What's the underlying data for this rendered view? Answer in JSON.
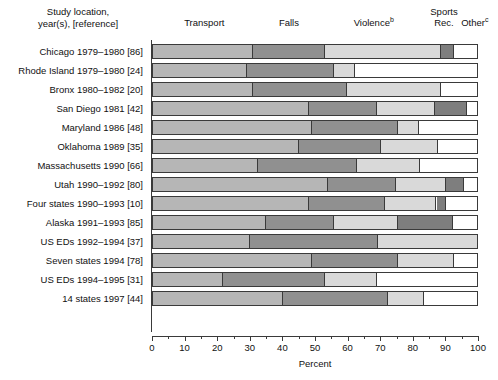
{
  "row_header": {
    "line1": "Study location,",
    "line2": "year(s), [reference]"
  },
  "axis": {
    "title": "Percent",
    "ticks": [
      0,
      10,
      20,
      30,
      40,
      50,
      60,
      70,
      80,
      90,
      100
    ],
    "tick_labels": [
      "0",
      "10",
      "20",
      "30",
      "40",
      "50",
      "60",
      "70",
      "80",
      "90",
      "100"
    ],
    "minor_ticks": [
      5,
      15,
      25,
      35,
      45,
      55,
      65,
      75,
      85,
      95
    ],
    "min": 0,
    "max": 100
  },
  "category_headers": [
    {
      "label": "Transport",
      "sup": "",
      "center_pct": 16
    },
    {
      "label": "Falls",
      "sup": "",
      "center_pct": 42
    },
    {
      "label": "Violence",
      "sup": "b",
      "center_pct": 68
    },
    {
      "label": "Sports Rec.",
      "sup": "",
      "center_pct": 89.5
    },
    {
      "label": "Other",
      "sup": "c",
      "center_pct": 99
    }
  ],
  "colors": {
    "transport": "#b6b6b6",
    "falls": "#909090",
    "violence": "#d9d9d9",
    "sports_rec": "#7e7e7e",
    "other": "#ffffff",
    "outline": "#3a3a3a",
    "text": "#111111",
    "background": "#ffffff"
  },
  "chart_data": {
    "type": "bar",
    "title": "",
    "subtitle": "",
    "orientation": "horizontal",
    "stacked": true,
    "stack_total": 100,
    "xlabel": "Percent",
    "ylabel": "Study location, year(s), [reference]",
    "xlim": [
      0,
      100
    ],
    "xticks": [
      0,
      10,
      20,
      30,
      40,
      50,
      60,
      70,
      80,
      90,
      100
    ],
    "grid": false,
    "legend": "column-headers-above-plot",
    "categories": [
      "Chicago 1979–1980 [86]",
      "Rhode Island 1979–1980 [24]",
      "Bronx 1980–1982 [20]",
      "San Diego 1981 [42]",
      "Maryland 1986 [48]",
      "Oklahoma 1989 [35]",
      "Massachusetts 1990 [66]",
      "Utah 1990–1992 [80]",
      "Four states 1990–1993 [10]",
      "Alaska 1991–1993 [85]",
      "US EDs 1992–1994 [37]",
      "Seven states 1994 [78]",
      "US EDs 1994–1995 [31]",
      "14 states 1997 [44]"
    ],
    "series": [
      {
        "name": "Transport",
        "color": "#b6b6b6",
        "values": [
          31,
          29,
          31,
          48,
          49,
          45,
          32.5,
          54,
          48,
          35,
          30,
          49,
          21.5,
          40
        ]
      },
      {
        "name": "Falls",
        "color": "#909090",
        "values": [
          22,
          27,
          29,
          21,
          26.5,
          25.5,
          30.5,
          21,
          23.5,
          21,
          39.5,
          26.5,
          31.5,
          32.5
        ]
      },
      {
        "name": "Violence",
        "color": "#d9d9d9",
        "values": [
          36,
          6.5,
          29,
          18,
          6.5,
          17.5,
          19.5,
          15.5,
          16,
          19.5,
          30.5,
          17.5,
          16,
          11
        ]
      },
      {
        "name": "Sports Rec.",
        "color": "#7e7e7e",
        "values": [
          4,
          0,
          0,
          10,
          0,
          0,
          0,
          5.5,
          3,
          17,
          0,
          0,
          0,
          0
        ]
      },
      {
        "name": "Other",
        "color": "#ffffff",
        "values": [
          7,
          37.5,
          11,
          3,
          18,
          12,
          17.5,
          4,
          9.5,
          7.5,
          0,
          7,
          31,
          16.5
        ]
      }
    ],
    "cumulative_boundaries": [
      [
        31,
        53,
        89,
        93,
        100
      ],
      [
        29,
        56,
        62.5,
        62.5,
        100
      ],
      [
        31,
        60,
        89,
        89,
        100
      ],
      [
        48,
        69,
        87,
        97,
        100
      ],
      [
        49,
        75.5,
        82,
        82,
        100
      ],
      [
        45,
        70.5,
        88,
        88,
        100
      ],
      [
        32.5,
        63,
        82.5,
        82.5,
        100
      ],
      [
        54,
        75,
        90.5,
        96,
        100
      ],
      [
        48,
        71.5,
        87.5,
        90.5,
        100
      ],
      [
        35,
        56,
        75.5,
        92.5,
        100
      ],
      [
        30,
        69.5,
        100,
        100,
        100
      ],
      [
        49,
        75.5,
        93,
        93,
        100
      ],
      [
        21.5,
        53,
        69,
        69,
        100
      ],
      [
        40,
        72.5,
        83.5,
        83.5,
        100
      ]
    ]
  }
}
